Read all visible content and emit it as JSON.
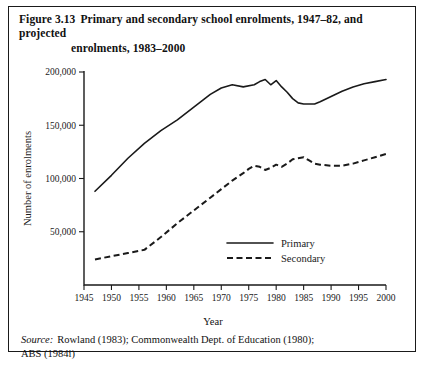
{
  "figure": {
    "number": "Figure 3.13",
    "title_line1": "Primary and secondary school enrolments, 1947–82, and projected",
    "title_line2": "enrolments, 1983–2000",
    "source_label": "Source:",
    "source_line1": "Rowland (1983); Commonwealth Dept. of Education (1980);",
    "source_line2": "ABS (1984i)"
  },
  "chart_data": {
    "type": "line",
    "title": "Primary and secondary school enrolments, 1947–82, and projected enrolments, 1983–2000",
    "xlabel": "Year",
    "ylabel": "Number of enrolments",
    "xlim": [
      1945,
      2000
    ],
    "ylim": [
      0,
      200000
    ],
    "grid": false,
    "legend_position": "inside-lower-right",
    "xticks": [
      1945,
      1950,
      1955,
      1960,
      1965,
      1970,
      1975,
      1980,
      1985,
      1990,
      1995,
      2000
    ],
    "xticklabels": [
      "1945",
      "1950",
      "1955",
      "1960",
      "1965",
      "1970",
      "1975",
      "1980",
      "1985",
      "1990",
      "1995",
      "2000"
    ],
    "yticks": [
      50000,
      100000,
      150000,
      200000
    ],
    "yticklabels": [
      "50,000",
      "100,000",
      "150,000",
      "200,000"
    ],
    "series": [
      {
        "name": "Primary",
        "style": "solid",
        "color": "#1a1a1a",
        "x": [
          1947,
          1950,
          1953,
          1956,
          1959,
          1962,
          1965,
          1968,
          1970,
          1972,
          1974,
          1976,
          1977,
          1978,
          1979,
          1980,
          1981,
          1982,
          1983,
          1984,
          1985,
          1986,
          1987,
          1988,
          1990,
          1992,
          1994,
          1996,
          1998,
          2000
        ],
        "values": [
          88000,
          103000,
          119000,
          133000,
          145000,
          155000,
          167000,
          179000,
          185000,
          188000,
          186000,
          188000,
          191000,
          193000,
          188000,
          192000,
          186000,
          181000,
          175000,
          171000,
          170000,
          170000,
          170000,
          172000,
          177000,
          182000,
          186000,
          189000,
          191000,
          193000
        ]
      },
      {
        "name": "Secondary",
        "style": "dashed",
        "color": "#1a1a1a",
        "x": [
          1947,
          1950,
          1953,
          1956,
          1959,
          1962,
          1965,
          1968,
          1970,
          1972,
          1974,
          1975,
          1976,
          1977,
          1978,
          1979,
          1980,
          1981,
          1982,
          1983,
          1984,
          1985,
          1986,
          1987,
          1988,
          1990,
          1992,
          1994,
          1996,
          1998,
          2000
        ],
        "values": [
          24000,
          27000,
          30000,
          33000,
          45000,
          58000,
          70000,
          82000,
          90000,
          98000,
          105000,
          109000,
          112000,
          111000,
          108000,
          110000,
          113000,
          111000,
          114000,
          118000,
          119000,
          120000,
          117000,
          114000,
          113000,
          112000,
          112000,
          114000,
          117000,
          120000,
          123000
        ]
      }
    ],
    "legend": [
      {
        "label": "Primary",
        "style": "solid"
      },
      {
        "label": "Secondary",
        "style": "dashed"
      }
    ]
  }
}
